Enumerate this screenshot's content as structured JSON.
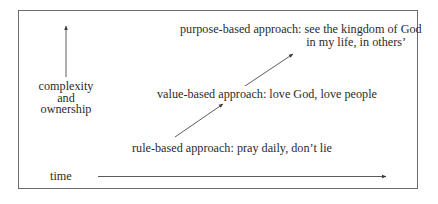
{
  "diagram": {
    "y_axis": {
      "label_lines": [
        "complexity",
        "and",
        "ownership"
      ],
      "icon": "arrow-up-icon"
    },
    "x_axis": {
      "label": "time",
      "icon": "arrow-right-icon"
    },
    "stages": [
      {
        "name": "rule-based",
        "text": "rule-based approach: pray daily, don’t lie"
      },
      {
        "name": "value-based",
        "text": "value-based approach: love God, love people"
      },
      {
        "name": "purpose-based",
        "text_line1": "purpose-based approach: see the kingdom of God",
        "text_line2": "in my life, in others’"
      }
    ],
    "colors": {
      "text": "#2b2b2b",
      "lines": "#4a4a4a",
      "border": "#6b6b6b",
      "background": "#ffffff"
    }
  }
}
